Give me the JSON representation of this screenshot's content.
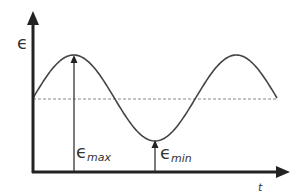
{
  "diagram": {
    "type": "sinusoidal signal with extrema",
    "y_axis_label": "ϵ",
    "x_axis_label": "t",
    "max_label": {
      "symbol": "ϵ",
      "subscript": "max"
    },
    "min_label": {
      "symbol": "ϵ",
      "subscript": "min"
    },
    "curve": {
      "shape": "sine",
      "cycles": 1.5,
      "start_phase": "rising from mean"
    },
    "mean_line": "dashed",
    "colors": {
      "axis": "#222222",
      "curve": "#444444",
      "dashed": "#888888",
      "text": "#333333"
    }
  }
}
